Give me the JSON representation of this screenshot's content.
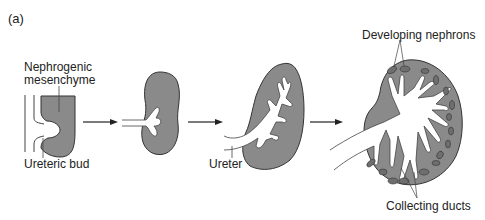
{
  "panel_label": "(a)",
  "labels": {
    "nephrogenic_line1": "Nephrogenic",
    "nephrogenic_line2": "mesenchyme",
    "ureteric_bud": "Ureteric bud",
    "ureter": "Ureter",
    "developing_nephrons": "Developing nephrons",
    "collecting_ducts": "Collecting ducts"
  },
  "colors": {
    "tissue_fill": "#8a8a8a",
    "outline": "#333333",
    "lumen": "#ffffff",
    "nephron_fill": "#6e6e6e"
  },
  "stages": [
    {
      "id": 1,
      "description": "ureteric bud contacting nephrogenic mesenchyme"
    },
    {
      "id": 2,
      "description": "early branching of ureteric bud"
    },
    {
      "id": 3,
      "description": "further branching; ureter forms"
    },
    {
      "id": 4,
      "description": "branched collecting ducts with developing nephrons"
    }
  ]
}
